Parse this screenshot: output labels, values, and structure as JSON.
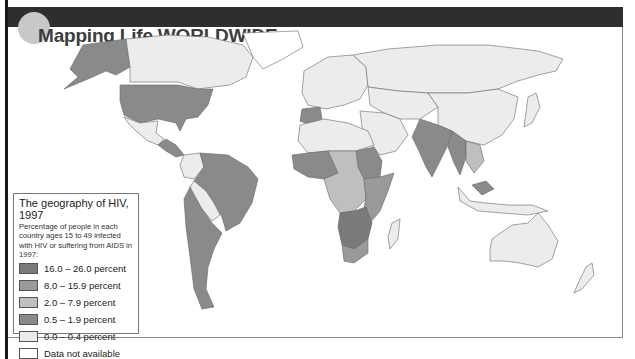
{
  "header": {
    "title": "Mapping Life WORLDWIDE"
  },
  "legend": {
    "title": "The geography of HIV, 1997",
    "description": "Percentage of people in each country ages 15 to 49 infected with HIV or suffering from AIDS in 1997:",
    "items": [
      {
        "label": "16.0 – 26.0 percent",
        "color": "#7a7a7a"
      },
      {
        "label": "8.0 – 15.9 percent",
        "color": "#9a9a9a"
      },
      {
        "label": "2.0 – 7.9 percent",
        "color": "#bfbfbf"
      },
      {
        "label": "0.5 – 1.9 percent",
        "color": "#8a8a8a"
      },
      {
        "label": "0.0 – 0.4 percent",
        "color": "#ececec"
      },
      {
        "label": "Data not available",
        "color": "#ffffff"
      }
    ]
  },
  "map": {
    "category_colors": {
      "c16_26": "#7a7a7a",
      "c8_15": "#9a9a9a",
      "c2_7": "#bfbfbf",
      "c05_19": "#8a8a8a",
      "c0_04": "#ececec",
      "na": "#ffffff"
    },
    "regions": [
      {
        "name": "alaska",
        "category": "c05_19"
      },
      {
        "name": "canada",
        "category": "c0_04"
      },
      {
        "name": "greenland",
        "category": "na"
      },
      {
        "name": "united-states",
        "category": "c05_19"
      },
      {
        "name": "mexico",
        "category": "c0_04"
      },
      {
        "name": "central-america",
        "category": "c05_19"
      },
      {
        "name": "northern-south-america",
        "category": "c0_04"
      },
      {
        "name": "brazil",
        "category": "c05_19"
      },
      {
        "name": "bolivia",
        "category": "c0_04"
      },
      {
        "name": "argentina-chile",
        "category": "c05_19"
      },
      {
        "name": "europe",
        "category": "c0_04"
      },
      {
        "name": "spain",
        "category": "c05_19"
      },
      {
        "name": "russia",
        "category": "c0_04"
      },
      {
        "name": "north-africa",
        "category": "c0_04"
      },
      {
        "name": "west-africa",
        "category": "c05_19"
      },
      {
        "name": "central-africa",
        "category": "c2_7"
      },
      {
        "name": "sudan",
        "category": "c05_19"
      },
      {
        "name": "east-africa",
        "category": "c8_15"
      },
      {
        "name": "southern-africa",
        "category": "c16_26"
      },
      {
        "name": "south-africa",
        "category": "c8_15"
      },
      {
        "name": "middle-east",
        "category": "c0_04"
      },
      {
        "name": "central-asia",
        "category": "c0_04"
      },
      {
        "name": "china",
        "category": "c0_04"
      },
      {
        "name": "india",
        "category": "c05_19"
      },
      {
        "name": "myanmar-thailand",
        "category": "c05_19"
      },
      {
        "name": "indochina",
        "category": "c2_7"
      },
      {
        "name": "japan",
        "category": "c0_04"
      },
      {
        "name": "indonesia",
        "category": "c0_04"
      },
      {
        "name": "malaysia",
        "category": "c05_19"
      },
      {
        "name": "australia",
        "category": "c0_04"
      },
      {
        "name": "new-zealand",
        "category": "c0_04"
      },
      {
        "name": "madagascar",
        "category": "c0_04"
      }
    ]
  }
}
